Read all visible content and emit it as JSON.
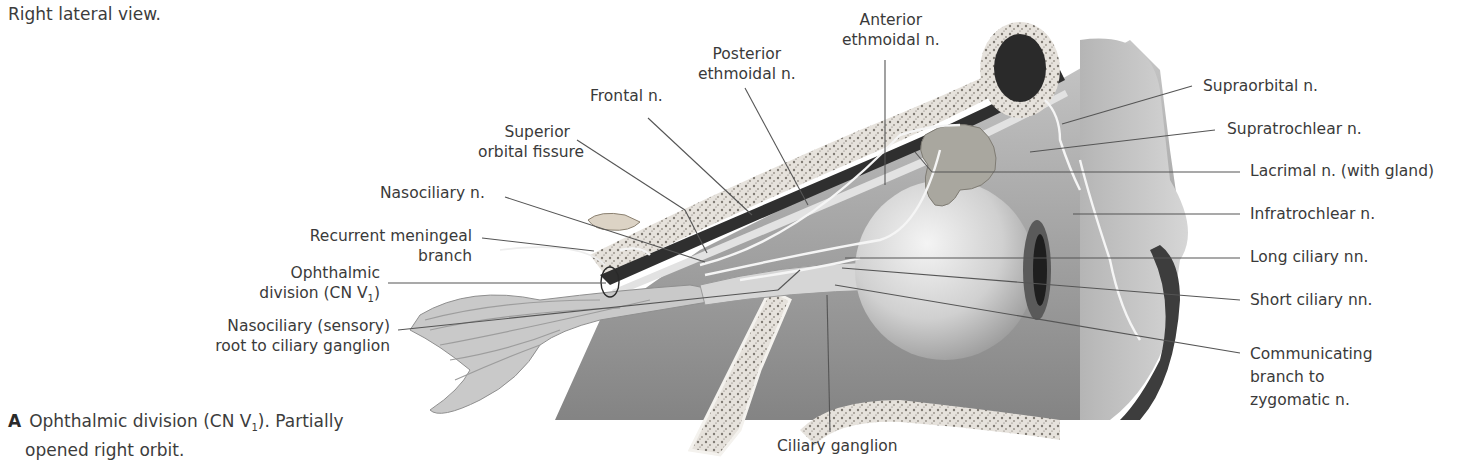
{
  "figure": {
    "subtitle": "Right lateral view.",
    "caption": {
      "letter": "A",
      "line1_pre": "Ophthalmic division (CN V",
      "line1_sub": "1",
      "line1_post": "). Partially",
      "line2": "opened right orbit."
    }
  },
  "labels": {
    "posterior_ethmoidal": [
      "Posterior",
      "ethmoidal n."
    ],
    "anterior_ethmoidal": [
      "Anterior",
      "ethmoidal n."
    ],
    "frontal": "Frontal n.",
    "superior_orbital_fissure": [
      "Superior",
      "orbital fissure"
    ],
    "nasociliary": "Nasociliary n.",
    "recurrent_meningeal": [
      "Recurrent meningeal",
      "branch"
    ],
    "ophthalmic_division": [
      "Ophthalmic",
      "division (CN V",
      "1",
      ")"
    ],
    "nasociliary_root": [
      "Nasociliary (sensory)",
      "root to ciliary ganglion"
    ],
    "ciliary_ganglion": "Ciliary ganglion",
    "supraorbital": "Supraorbital n.",
    "supratrochlear": "Supratrochlear n.",
    "lacrimal": "Lacrimal n. (with gland)",
    "infratrochlear": "Infratrochlear n.",
    "long_ciliary": "Long ciliary nn.",
    "short_ciliary": "Short ciliary nn.",
    "communicating_branch": [
      "Communicating",
      "branch to",
      "zygomatic n."
    ]
  },
  "colors": {
    "text": "#3a3a3a",
    "leader_line": "#555555",
    "bone": "#e9e6e1",
    "bone_speckle": "#8a857d",
    "soft_tissue": "#b9b9b9",
    "dark_tissue": "#4a4a4a",
    "eyeball": "#d8d8d8",
    "gland": "#a8a59c",
    "nerve": "#f2f2f2"
  }
}
